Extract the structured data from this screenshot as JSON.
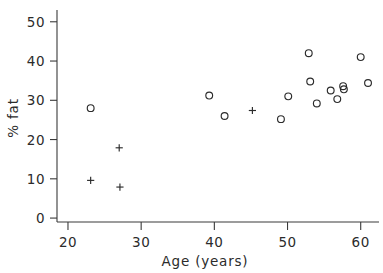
{
  "chart_data": {
    "type": "scatter",
    "title": "",
    "xlabel": "Age (years)",
    "ylabel": "% fat",
    "xlim": [
      18.5,
      62.5
    ],
    "ylim": [
      -1,
      53
    ],
    "grid": false,
    "legend": "none",
    "xticks": [
      20,
      30,
      40,
      50,
      60
    ],
    "xtick_labels": [
      "20",
      "30",
      "40",
      "50",
      "60"
    ],
    "yticks": [
      0,
      10,
      20,
      30,
      40,
      50
    ],
    "ytick_labels": [
      "0",
      "10",
      "20",
      "30",
      "40",
      "50"
    ],
    "series": [
      {
        "name": "circle-marker-group",
        "marker": "circle",
        "points": [
          {
            "x": 23.1,
            "y": 28.0
          },
          {
            "x": 39.3,
            "y": 31.2
          },
          {
            "x": 41.4,
            "y": 26.0
          },
          {
            "x": 49.1,
            "y": 25.2
          },
          {
            "x": 50.1,
            "y": 31.0
          },
          {
            "x": 52.9,
            "y": 42.0
          },
          {
            "x": 53.1,
            "y": 34.8
          },
          {
            "x": 54.0,
            "y": 29.2
          },
          {
            "x": 55.9,
            "y": 32.5
          },
          {
            "x": 56.8,
            "y": 30.3
          },
          {
            "x": 57.6,
            "y": 33.6
          },
          {
            "x": 57.7,
            "y": 32.8
          },
          {
            "x": 60.0,
            "y": 41.0
          },
          {
            "x": 61.0,
            "y": 34.4
          }
        ]
      },
      {
        "name": "plus-marker-group",
        "marker": "plus",
        "points": [
          {
            "x": 23.1,
            "y": 9.6
          },
          {
            "x": 27.0,
            "y": 17.9
          },
          {
            "x": 27.1,
            "y": 7.9
          },
          {
            "x": 45.2,
            "y": 27.4
          }
        ]
      }
    ]
  },
  "style": {
    "axis_color": "#3a3a3a",
    "text_color": "#2b2b2b",
    "marker_color": "#2b2b2b",
    "background": "#ffffff"
  }
}
